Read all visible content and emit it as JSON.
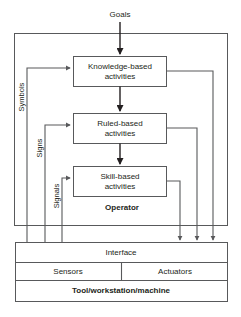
{
  "diagram": {
    "title": "Goals",
    "input_label": "Goals",
    "operator_label": "Operator",
    "activity_boxes": [
      {
        "id": "knowledge",
        "line1": "Knowledge-based",
        "line2": "activities"
      },
      {
        "id": "ruled",
        "line1": "Ruled-based",
        "line2": "activities"
      },
      {
        "id": "skill",
        "line1": "Skill-based",
        "line2": "activities"
      }
    ],
    "feedback_labels": [
      {
        "id": "symbols",
        "label": "Symbols"
      },
      {
        "id": "signs",
        "label": "Signs"
      },
      {
        "id": "signals",
        "label": "Signals"
      }
    ],
    "machine_rows": {
      "interface": "Interface",
      "sensors": "Sensors",
      "actuators": "Actuators",
      "machine": "Tool/workstation/machine"
    },
    "colors": {
      "background": "#ffffff",
      "box_stroke": "#58595b",
      "flow_stroke": "#231f20",
      "text": "#231f20"
    }
  }
}
